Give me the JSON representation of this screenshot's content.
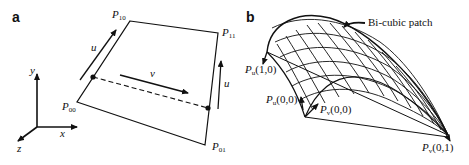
{
  "panel_a": {
    "letter": "a",
    "axes": {
      "x": "x",
      "y": "y",
      "z": "z"
    },
    "corners": [
      {
        "base": "P",
        "sub": "10"
      },
      {
        "base": "P",
        "sub": "11"
      },
      {
        "base": "P",
        "sub": "00"
      },
      {
        "base": "P",
        "sub": "01"
      }
    ],
    "arrows": {
      "u_left": "u",
      "u_right": "u",
      "v": "v"
    }
  },
  "panel_b": {
    "letter": "b",
    "callout": "Bi-cubic patch",
    "labels": [
      {
        "base": "P",
        "sub": "u",
        "args": "(1,0)"
      },
      {
        "base": "P",
        "sub": "u",
        "args": "(0,0)"
      },
      {
        "base": "P",
        "sub": "v",
        "args": "(0,0)"
      },
      {
        "base": "P",
        "sub": "v",
        "args": "(0,1)"
      }
    ]
  }
}
